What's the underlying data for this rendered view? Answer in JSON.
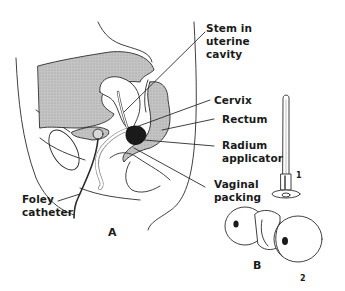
{
  "figure": {
    "panels": [
      {
        "id": "A",
        "label": "A",
        "description": "Sagittal section of female pelvis with radium applicator in place"
      },
      {
        "id": "B",
        "label": "B",
        "description": "Radium applicator components"
      }
    ],
    "labels": {
      "stem": "Stem in\nuterine\ncavity",
      "cervix": "Cervix",
      "rectum": "Rectum",
      "radium": "Radium\napplicator",
      "vaginal": "Vaginal\npacking",
      "foley": "Foley\ncatheter"
    },
    "part_numbers": {
      "stem_part": "1",
      "ovoid_part": "2"
    },
    "colors": {
      "line": "#2a2a2a",
      "shade": "#bdbdbd",
      "applicator": "#1a1a1a"
    }
  }
}
